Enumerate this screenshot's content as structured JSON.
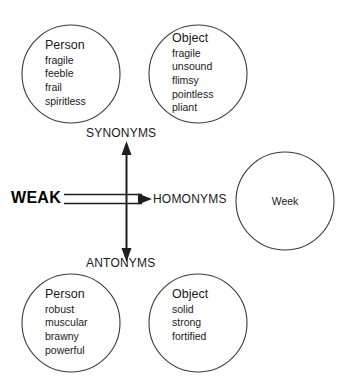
{
  "diagram": {
    "root": {
      "label": "WEAK"
    },
    "branches": {
      "synonyms_label": "SYNONYMS",
      "antonyms_label": "ANTONYMS",
      "homonyms_label": "HOMONYMS"
    },
    "groups": {
      "synonyms_person": {
        "heading": "Person",
        "words": [
          "fragile",
          "feeble",
          "frail",
          "spiritless"
        ]
      },
      "synonyms_object": {
        "heading": "Object",
        "words": [
          "fragile",
          "unsound",
          "flimsy",
          "pointless",
          "pliant"
        ]
      },
      "antonyms_person": {
        "heading": "Person",
        "words": [
          "robust",
          "muscular",
          "brawny",
          "powerful"
        ]
      },
      "antonyms_object": {
        "heading": "Object",
        "words": [
          "solid",
          "strong",
          "fortified"
        ]
      },
      "homonyms_word": {
        "text": "Week"
      }
    },
    "colors": {
      "stroke": "#333333",
      "text": "#1a1a1a",
      "background": "#ffffff"
    }
  }
}
